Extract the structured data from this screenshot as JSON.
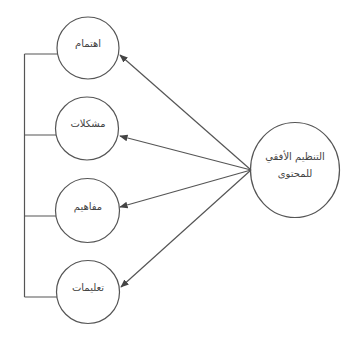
{
  "diagram": {
    "hub": {
      "label_line1": "التنظيم الأفقي",
      "label_line2": "للمحتوى"
    },
    "nodes": [
      {
        "label": "اهتمام"
      },
      {
        "label": "مشكلات"
      },
      {
        "label": "مفاهيم"
      },
      {
        "label": "تعليمات"
      }
    ],
    "colors": {
      "stroke": "#555555",
      "text": "#444444",
      "background": "#ffffff"
    }
  }
}
